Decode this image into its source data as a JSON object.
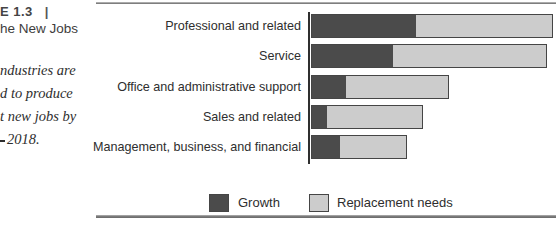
{
  "figure": {
    "label_fragment": "E 1.3",
    "label_divider": "|",
    "title_fragment": "he New Jobs",
    "caption_lines": [
      "ndustries are",
      "d to produce",
      "t new jobs by",
      "2018."
    ]
  },
  "chart_data": {
    "type": "bar",
    "orientation": "horizontal",
    "stacked": true,
    "grid": false,
    "x_axis_labels_visible": false,
    "legend_position": "bottom",
    "categories": [
      "Professional and related",
      "Service",
      "Office and administrative support",
      "Sales and related",
      "Management, business, and financial"
    ],
    "series": [
      {
        "name": "Growth",
        "color": "#4b4b4b",
        "values": [
          105,
          82,
          35,
          16,
          29
        ]
      },
      {
        "name": "Replacement needs",
        "color": "#cccccc",
        "values": [
          137,
          154,
          103,
          96,
          67
        ]
      }
    ],
    "value_unit": "relative-length",
    "totals": [
      242,
      236,
      138,
      112,
      96
    ]
  },
  "legend": {
    "items": [
      {
        "label": "Growth",
        "color": "#4b4b4b"
      },
      {
        "label": "Replacement needs",
        "color": "#cccccc"
      }
    ]
  },
  "colors": {
    "bar_border": "#454545",
    "axis_line": "#2f2f2f",
    "rule": "#7e7e7e",
    "text": "#2e2e2e"
  }
}
